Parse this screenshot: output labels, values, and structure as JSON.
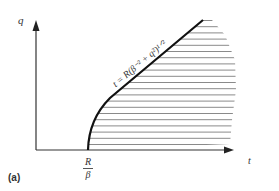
{
  "figure": {
    "panel_label": "(a)",
    "axes": {
      "x_label": "t",
      "y_label": "q"
    },
    "x_tick": {
      "numerator": "R",
      "denominator": "β"
    },
    "curve_label": "t = R(β⁻² + q²)¹ᐟ²",
    "region": "hatched region to the right of curve",
    "colors": {
      "axis": "#333333",
      "curve": "#111111",
      "hatch": "#888888"
    }
  }
}
